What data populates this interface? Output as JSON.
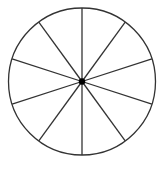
{
  "diagram": {
    "type": "circle-divided-into-sectors",
    "sector_count": 10,
    "center": {
      "x": 82,
      "y": 81.5
    },
    "radius": 73.5,
    "start_angle_deg": 90,
    "stroke_color": "#333333",
    "fill_color": "#ffffff",
    "center_dot_color": "#000000",
    "center_dot_radius": 3.2
  }
}
